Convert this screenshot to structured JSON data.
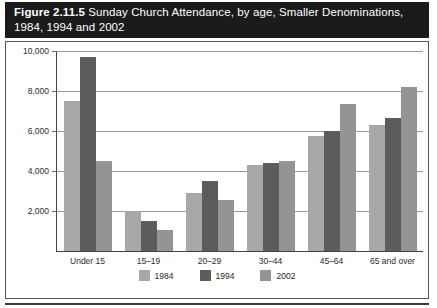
{
  "figure": {
    "number": "Figure 2.11.5",
    "caption_line1": "Sunday Church Attendance, by age, Smaller Denominations,",
    "caption_line2": "1984, 1994 and 2002"
  },
  "chart_data": {
    "type": "bar",
    "title": "Sunday Church Attendance, by age, Smaller Denominations, 1984, 1994 and 2002",
    "xlabel": "",
    "ylabel": "",
    "categories": [
      "Under 15",
      "15–19",
      "20–29",
      "30–44",
      "45–64",
      "65 and over"
    ],
    "series": [
      {
        "name": "1984",
        "color": "#a8a8a8",
        "values": [
          7500,
          2000,
          2900,
          4300,
          5750,
          6300
        ]
      },
      {
        "name": "1994",
        "color": "#5c5c5c",
        "values": [
          9700,
          1500,
          3500,
          4400,
          6000,
          6650
        ]
      },
      {
        "name": "2002",
        "color": "#949494",
        "values": [
          4500,
          1050,
          2550,
          4500,
          7350,
          8200
        ]
      }
    ],
    "ylim": [
      0,
      10000
    ],
    "yticks": [
      2000,
      4000,
      6000,
      8000,
      10000
    ],
    "ytick_labels": [
      "2,000",
      "4,000",
      "6,000",
      "8,000",
      "10,000"
    ],
    "grid": true,
    "legend_position": "bottom"
  }
}
